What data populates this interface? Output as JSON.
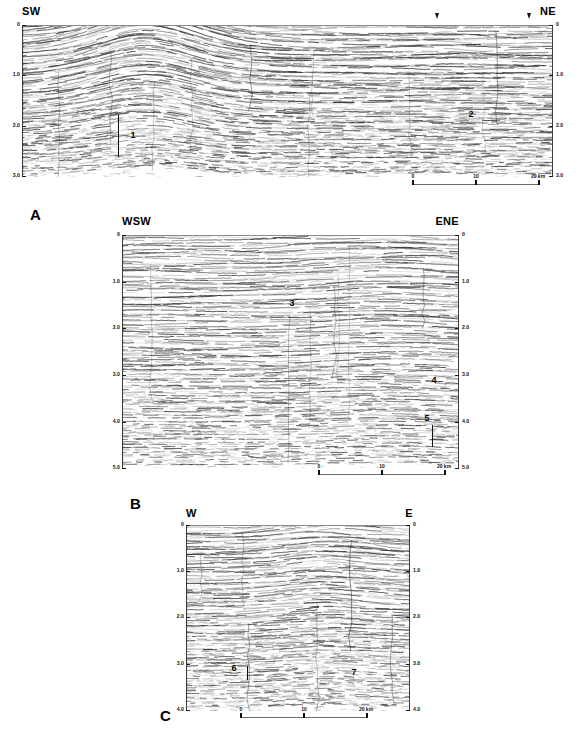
{
  "figure": {
    "type": "seismic-reflection-profiles",
    "panel_count": 3,
    "background_color": "#ffffff",
    "line_color": "#2b2b2b"
  },
  "panels": [
    {
      "letter": "A",
      "left_orientation": "SW",
      "right_orientation": "NE",
      "y_axis": {
        "label_left": [
          "0",
          "1.0",
          "2.0",
          "3.0"
        ],
        "label_right": [
          "0",
          "1.0",
          "2.0",
          "3.0"
        ],
        "values": [
          0,
          1.0,
          2.0,
          3.0
        ],
        "unit": "s twt",
        "min": 0,
        "max": 3.0
      },
      "scalebar": {
        "labels": [
          "0",
          "10",
          "20 km"
        ],
        "values": [
          0,
          10,
          20
        ],
        "unit": "km"
      },
      "annotations": [
        {
          "text": "1",
          "x_frac": 0.245,
          "y_frac": 0.775
        },
        {
          "text": "2",
          "x_frac": 0.882,
          "y_frac": 0.695
        }
      ],
      "markers": [
        {
          "x_frac": 0.812
        },
        {
          "x_frac": 0.968
        }
      ]
    },
    {
      "letter": "B",
      "left_orientation": "WSW",
      "right_orientation": "ENE",
      "y_axis": {
        "label_left": [
          "0",
          "1.0",
          "2.0",
          "3.0",
          "4.0",
          "5.0"
        ],
        "label_right": [
          "0",
          "1.0",
          "2.0",
          "3.0",
          "4.0",
          "5.0"
        ],
        "values": [
          0,
          1.0,
          2.0,
          3.0,
          4.0,
          5.0
        ],
        "unit": "s twt",
        "min": 0,
        "max": 5.0
      },
      "scalebar": {
        "labels": [
          "0",
          "10",
          "20 km"
        ],
        "values": [
          0,
          10,
          20
        ],
        "unit": "km"
      },
      "annotations": [
        {
          "text": "3",
          "x_frac": 0.505,
          "y_frac": 0.3
        },
        {
          "text": "4",
          "x_frac": 0.925,
          "y_frac": 0.62
        },
        {
          "text": "5",
          "x_frac": 0.905,
          "y_frac": 0.79
        }
      ],
      "markers": []
    },
    {
      "letter": "C",
      "left_orientation": "W",
      "right_orientation": "E",
      "y_axis": {
        "label_left": [
          "0",
          "1.0",
          "2.0",
          "3.0",
          "4.0"
        ],
        "label_right": [
          "0",
          "1.0",
          "2.0",
          "3.0",
          "4.0"
        ],
        "values": [
          0,
          1.0,
          2.0,
          3.0,
          4.0
        ],
        "unit": "s twt",
        "min": 0,
        "max": 4.0
      },
      "scalebar": {
        "labels": [
          "0",
          "10",
          "20 km"
        ],
        "values": [
          0,
          10,
          20
        ],
        "unit": "km"
      },
      "annotations": [
        {
          "text": "6",
          "x_frac": 0.225,
          "y_frac": 0.805
        },
        {
          "text": "7",
          "x_frac": 0.715,
          "y_frac": 0.83
        }
      ],
      "markers": []
    }
  ]
}
